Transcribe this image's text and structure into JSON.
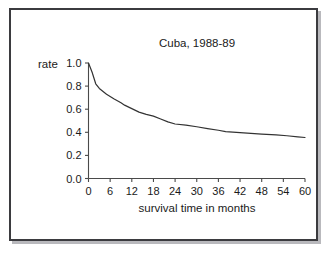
{
  "figure": {
    "frame_color": "#3b3b3f",
    "shadow_color": "#b9b9bd",
    "background": "#ffffff"
  },
  "chart_data": {
    "type": "line",
    "title": "Cuba, 1988-89",
    "xlabel": "survival time in months",
    "ylabel": "rate",
    "ylabel_position": "top-left",
    "line_color": "#333333",
    "grid": false,
    "legend": "none",
    "xlim": [
      0,
      60
    ],
    "ylim": [
      0.0,
      1.0
    ],
    "xticks": [
      0,
      6,
      12,
      18,
      24,
      30,
      36,
      42,
      48,
      54,
      60
    ],
    "xtick_labels": [
      "0",
      "6",
      "12",
      "18",
      "24",
      "30",
      "36",
      "42",
      "48",
      "54",
      "60"
    ],
    "yticks": [
      0.0,
      0.2,
      0.4,
      0.6,
      0.8,
      1.0
    ],
    "ytick_labels": [
      "0.0",
      "0.2",
      "0.4",
      "0.6",
      "0.8",
      "1.0"
    ],
    "series": [
      {
        "name": "survival rate",
        "x": [
          0,
          1,
          2,
          3,
          5,
          7,
          9,
          10,
          12,
          14,
          16,
          18,
          20,
          22,
          24,
          27,
          30,
          33,
          36,
          38,
          40,
          44,
          48,
          52,
          55,
          58,
          60
        ],
        "y": [
          1.0,
          0.92,
          0.82,
          0.78,
          0.73,
          0.69,
          0.655,
          0.635,
          0.605,
          0.575,
          0.555,
          0.54,
          0.515,
          0.49,
          0.472,
          0.462,
          0.448,
          0.432,
          0.418,
          0.406,
          0.401,
          0.392,
          0.385,
          0.377,
          0.37,
          0.361,
          0.355
        ]
      }
    ]
  }
}
